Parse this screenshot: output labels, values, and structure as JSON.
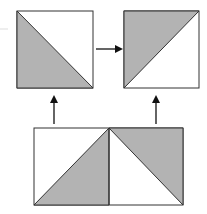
{
  "diagram": {
    "colors": {
      "shade": "#b3b3b3",
      "stroke": "#333333",
      "background": "#ffffff",
      "arrow": "#111111"
    },
    "shapes": {
      "top_left_square": {
        "x": 17,
        "y": 11,
        "w": 76,
        "h": 77,
        "shaded": "lower-left triangle",
        "diagonal": "top-left to bottom-right"
      },
      "top_right_square": {
        "x": 124,
        "y": 11,
        "w": 75,
        "h": 77,
        "shaded": "upper-left triangle",
        "diagonal": "bottom-left to top-right"
      },
      "bottom_rectangle": {
        "x": 34,
        "y": 128,
        "w": 149,
        "h": 77,
        "left_half": {
          "shaded": "lower-right triangle",
          "diagonal": "bottom-left to top-right"
        },
        "right_half": {
          "shaded": "upper-right triangle",
          "diagonal": "top-left to bottom-right"
        }
      }
    },
    "arrows": [
      {
        "name": "top-left-to-top-right",
        "direction": "right"
      },
      {
        "name": "bottom-left-to-top-left",
        "direction": "up"
      },
      {
        "name": "bottom-right-to-top-right",
        "direction": "up"
      }
    ]
  }
}
